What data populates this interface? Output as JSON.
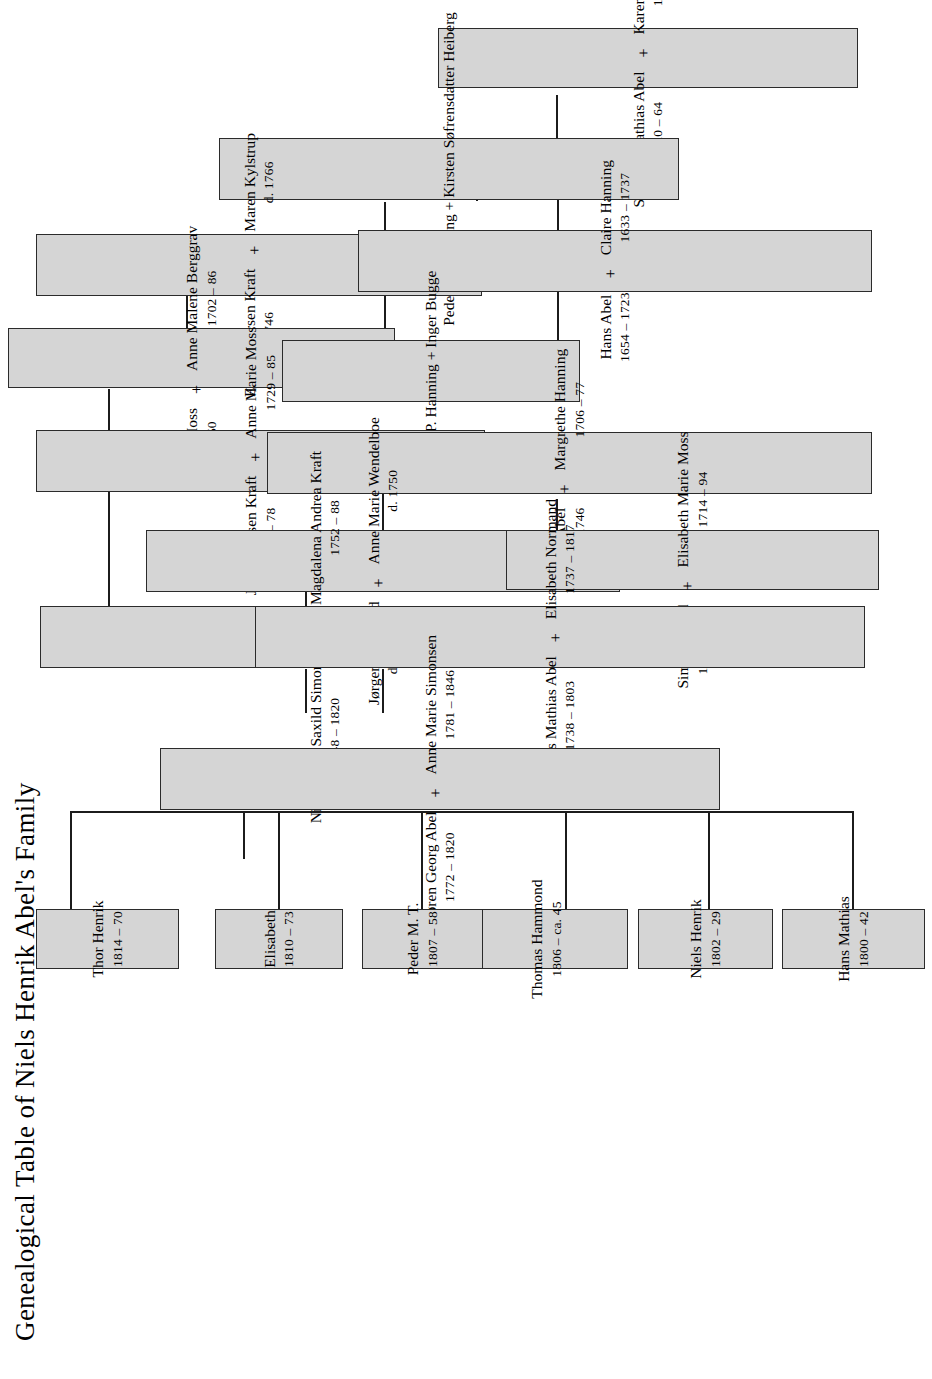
{
  "title": "Genealogical Table of Niels Henrik Abel's Family",
  "plus": "+",
  "nodes": {
    "stamfar": {
      "name_a": "Stamfar Mathias Abel",
      "dates_a": "ca. 1620 – 64",
      "name_b": "Karen Rasmusdatter",
      "dates_b": "1633 – 1712"
    },
    "peder_o_hanning": {
      "text": "Peder O. Hanning + Kirsten Søfrensdatter Heiberg"
    },
    "hans_abel": {
      "name_a": "Hans Abel",
      "dates_a": "1654 – 1723",
      "name_b": "Claire Hanning",
      "dates_b": "1633 – 1737"
    },
    "peder_p_hanning": {
      "text": "Peder P. Hanning + Inger Bugge"
    },
    "jorgen_normand": {
      "name_a": "Jørgen Normand",
      "dates_a": "d. 1737",
      "name_b": "Anne Marie Wendelboe",
      "dates_b": "d. 1750"
    },
    "soren_abel": {
      "name_a": "Søren Abel",
      "dates_a": "1698 – 1746",
      "name_b": "Margrethe Hanning",
      "dates_b": "1706 – 77"
    },
    "hans_mathias_abel": {
      "name_a": "Hans Mathias Abel",
      "dates_a": "1738 – 1803",
      "name_b": "Elisabeth Normand",
      "dates_b": "1737 – 1817"
    },
    "even_kraft": {
      "name_a": "Even Pedersen Kraft",
      "dates_a": "d. 1746",
      "name_b": "Maren Kylstrup",
      "dates_b": "d. 1766"
    },
    "anders_moss": {
      "name_a": "Anders Moss",
      "dates_a": "1700 – 50",
      "name_b": "Anne Malene Berggrav",
      "dates_b": "1702 – 86"
    },
    "jens_kraft": {
      "name_a": "Jens Evensen Kraft",
      "dates_a": "1722 – 78",
      "name_b": "Anne Marie Moss",
      "dates_b": "1729 – 85"
    },
    "simon_saxild": {
      "name_a": "Simon Saxild",
      "dates_a": "1702 – 50",
      "name_b": "Elisabeth Marie Moss",
      "dates_b": "1714 – 94"
    },
    "nils_simonsen": {
      "name_a": "Nils Henrik Saxild Simonsen",
      "dates_a": "1748 – 1820",
      "name_b": "Magdalena Andrea Kraft",
      "dates_b": "1752 – 88"
    },
    "soren_georg_abel": {
      "name_a": "Søren Georg Abel",
      "dates_a": "1772 – 1820",
      "name_b": "Anne Marie Simonsen",
      "dates_b": "1781 – 1846"
    }
  },
  "children": [
    {
      "name": "Hans Mathias",
      "dates": "1800 – 42"
    },
    {
      "name": "Niels Henrik",
      "dates": "1802 – 29"
    },
    {
      "name": "Thomas Hammond",
      "dates": "1806 – ca. 45"
    },
    {
      "name": "Peder M. T.",
      "dates": "1807 – 58"
    },
    {
      "name": "Elisabeth",
      "dates": "1810 – 73"
    },
    {
      "name": "Thor Henrik",
      "dates": "1814 – 70"
    }
  ],
  "colors": {
    "box_fill": "#d5d5d5",
    "box_border": "#2b2b2b",
    "line": "#1c1c1c",
    "text": "#000000",
    "page_bg": "#ffffff"
  }
}
